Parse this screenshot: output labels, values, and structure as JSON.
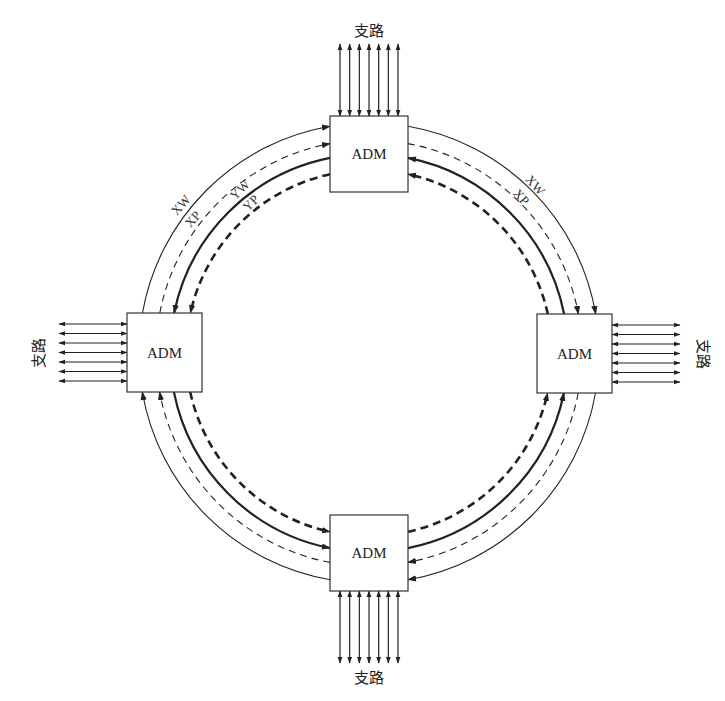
{
  "diagram": {
    "type": "ring-network",
    "center": [
      369,
      353
    ],
    "nodes": [
      {
        "id": "top",
        "label": "ADM",
        "box": [
          330,
          116,
          78,
          76
        ],
        "tributary_side": "top",
        "tributary_label": "支路"
      },
      {
        "id": "right",
        "label": "ADM",
        "box": [
          537,
          314,
          75,
          79
        ],
        "tributary_side": "right",
        "tributary_label": "支路"
      },
      {
        "id": "bottom",
        "label": "ADM",
        "box": [
          330,
          515,
          78,
          76
        ],
        "tributary_side": "bottom",
        "tributary_label": "支路"
      },
      {
        "id": "left",
        "label": "ADM",
        "box": [
          127,
          313,
          75,
          79
        ],
        "tributary_side": "left",
        "tributary_label": "支路"
      }
    ],
    "tributary_count": 7,
    "rings": [
      {
        "name": "XW",
        "radius": 230,
        "style": "solid-thin",
        "direction": "clockwise"
      },
      {
        "name": "XP",
        "radius": 213,
        "style": "dashed-thin",
        "direction": "clockwise"
      },
      {
        "name": "YW",
        "radius": 199,
        "style": "solid-thick",
        "direction": "counterclockwise"
      },
      {
        "name": "YP",
        "radius": 183,
        "style": "dashed-thick",
        "direction": "counterclockwise"
      }
    ],
    "ring_labels": {
      "top_left_outer": [
        "XW",
        "XP"
      ],
      "top_left_inner": [
        "YW",
        "YP"
      ],
      "top_right_outer": [
        "XW",
        "XP"
      ]
    },
    "colors": {
      "stroke": "#222222",
      "background": "#ffffff"
    }
  }
}
